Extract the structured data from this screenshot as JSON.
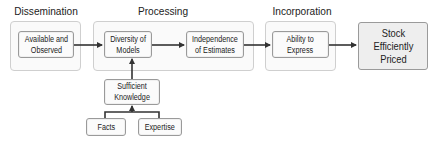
{
  "diagram": {
    "groups": [
      {
        "id": "dissemination",
        "title": "Dissemination"
      },
      {
        "id": "processing",
        "title": "Processing"
      },
      {
        "id": "incorporation",
        "title": "Incorporation"
      }
    ],
    "nodes": {
      "available_observed": "Available and\nObserved",
      "diversity_models": "Diversity of\nModels",
      "independence_estimates": "Independence\nof Estimates",
      "ability_express": "Ability to\nExpress",
      "stock_priced": "Stock\nEfficiently\nPriced",
      "sufficient_knowledge": "Sufficient\nKnowledge",
      "facts": "Facts",
      "expertise": "Expertise"
    },
    "edges": [
      {
        "from": "Available and Observed",
        "to": "Diversity of Models"
      },
      {
        "from": "Diversity of Models",
        "to": "Independence of Estimates"
      },
      {
        "from": "Independence of Estimates",
        "to": "Ability to Express"
      },
      {
        "from": "Ability to Express",
        "to": "Stock Efficiently Priced"
      },
      {
        "from": "Sufficient Knowledge",
        "to": "Diversity of Models"
      },
      {
        "from": "Facts",
        "to": "Sufficient Knowledge"
      },
      {
        "from": "Expertise",
        "to": "Sufficient Knowledge"
      }
    ]
  }
}
